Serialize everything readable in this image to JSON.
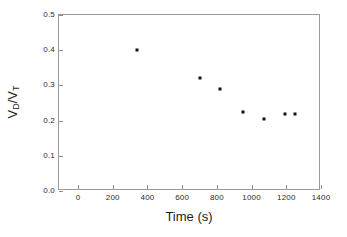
{
  "chart_data": {
    "type": "scatter",
    "title": "",
    "xlabel": "Time (s)",
    "ylabel": "VD/VT",
    "ylabel_parts": {
      "v1": "V",
      "sub1": "D",
      "slash": "/V",
      "sub2": "T"
    },
    "xlim": [
      -110,
      1400
    ],
    "ylim": [
      0.0,
      0.5
    ],
    "xticks": [
      0,
      200,
      400,
      600,
      800,
      1000,
      1200,
      1400
    ],
    "xtick_labels": [
      "0",
      "200",
      "400",
      "600",
      "800",
      "1000",
      "1200",
      "1400"
    ],
    "yticks": [
      0.0,
      0.1,
      0.2,
      0.3,
      0.4,
      0.5
    ],
    "ytick_labels": [
      "0.0",
      "0.1",
      "0.2",
      "0.3",
      "0.4",
      "0.5"
    ],
    "grid": false,
    "legend": false,
    "marker_color": "#111111",
    "frame_color": "#9a9a9a",
    "series": [
      {
        "name": "VD/VT vs time",
        "x": [
          338,
          700,
          820,
          950,
          1070,
          1190,
          1250
        ],
        "y": [
          0.4,
          0.32,
          0.29,
          0.225,
          0.205,
          0.218,
          0.218
        ]
      }
    ]
  }
}
